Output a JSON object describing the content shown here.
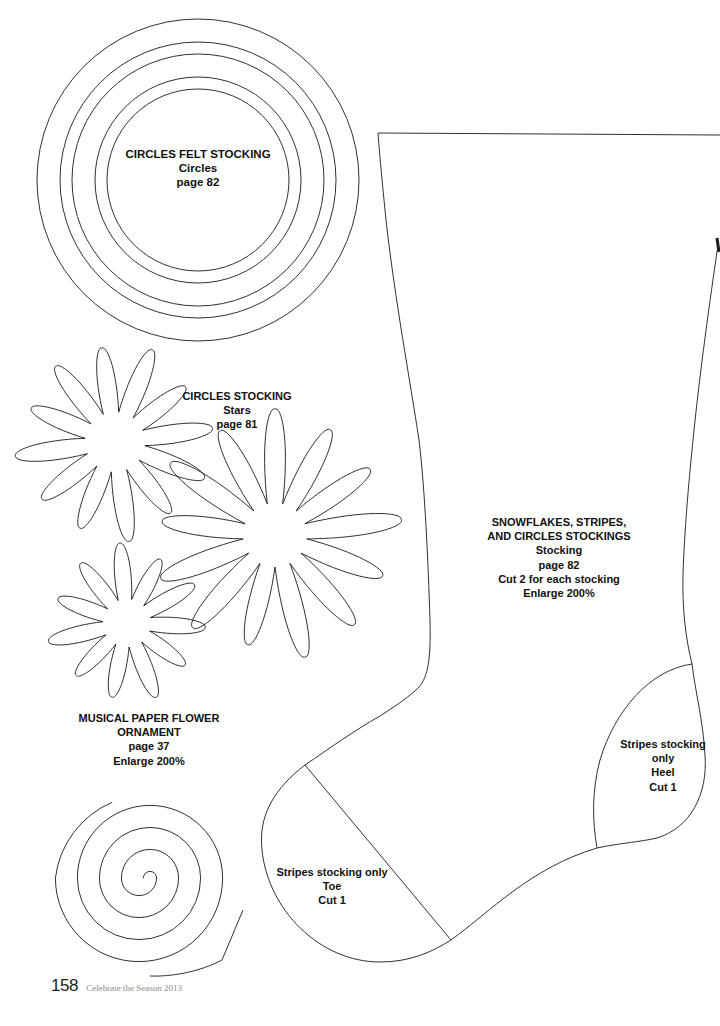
{
  "labels": {
    "circles": {
      "lines": [
        "CIRCLES FELT STOCKING",
        "Circles",
        "page 82"
      ]
    },
    "stars": {
      "lines": [
        "CIRCLES STOCKING",
        "Stars",
        "page 81"
      ]
    },
    "ornament": {
      "lines": [
        "MUSICAL PAPER FLOWER",
        "ORNAMENT",
        "page 37",
        "Enlarge 200%"
      ]
    },
    "stocking": {
      "lines": [
        "SNOWFLAKES, STRIPES,",
        "AND CIRCLES STOCKINGS",
        "Stocking",
        "page 82",
        "Cut 2 for each stocking",
        "Enlarge 200%"
      ]
    },
    "heel": {
      "lines": [
        "Stripes stocking",
        "only",
        "Heel",
        "Cut 1"
      ]
    },
    "toe": {
      "lines": [
        "Stripes stocking only",
        "Toe",
        "Cut 1"
      ]
    }
  },
  "footer": {
    "page_number": "158",
    "publication": "Celebrate the Season 2013"
  },
  "shapes": {
    "circles": {
      "cx": 198,
      "cy": 180,
      "radii": [
        161,
        138,
        126,
        103,
        91
      ]
    },
    "stars": [
      {
        "cx": 115,
        "cy": 442,
        "outer": 95,
        "inner": 30,
        "petals": 12,
        "rotation": -8
      },
      {
        "cx": 275,
        "cy": 535,
        "outer": 120,
        "inner": 32,
        "petals": 13,
        "rotation": 0
      },
      {
        "cx": 127,
        "cy": 623,
        "outer": 76,
        "inner": 24,
        "petals": 11,
        "rotation": -5
      }
    ],
    "spiral": {
      "cx": 150,
      "cy": 878,
      "gap": 22,
      "turns": 4
    },
    "colors": {
      "stroke": "#1a1a1a",
      "background": "#ffffff"
    }
  }
}
